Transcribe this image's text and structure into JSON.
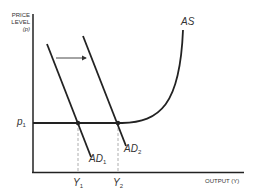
{
  "diagram": {
    "y_axis": {
      "title_line1": "PRICE",
      "title_line2": "LEVEL",
      "title_line3": "(p)",
      "tick": {
        "base": "p",
        "sub": "1"
      }
    },
    "x_axis": {
      "title": "OUTPUT (Y)",
      "ticks": [
        {
          "base": "Y",
          "sub": "1"
        },
        {
          "base": "Y",
          "sub": "2"
        }
      ]
    },
    "curves": {
      "as": {
        "label": "AS"
      },
      "ad1": {
        "base": "AD",
        "sub": "1"
      },
      "ad2": {
        "base": "AD",
        "sub": "2"
      }
    },
    "annotations": {
      "shift_arrow": "rightward shift of aggregate demand"
    },
    "colors": {
      "line": "#222222",
      "dashed": "#999999",
      "text": "#333333"
    }
  }
}
